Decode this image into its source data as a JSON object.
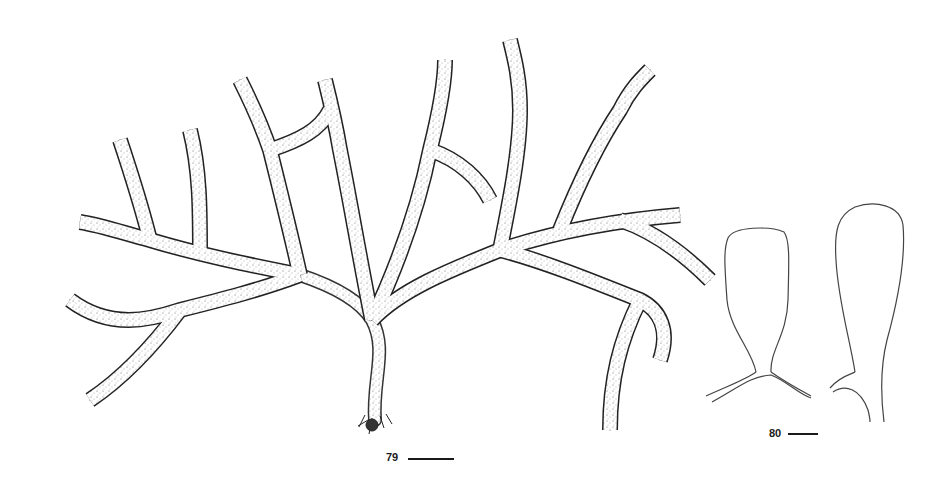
{
  "plate": {
    "figures": [
      {
        "number": "79",
        "description": "Habit of dichotomously branched stippled thallus with holdfast",
        "scale_bar": true
      },
      {
        "number": "80",
        "description": "Two outline drawings of club-shaped branch tips / vesicles",
        "scale_bar": true
      }
    ]
  },
  "colors": {
    "ink": "#1a1a1a",
    "background": "#ffffff"
  }
}
